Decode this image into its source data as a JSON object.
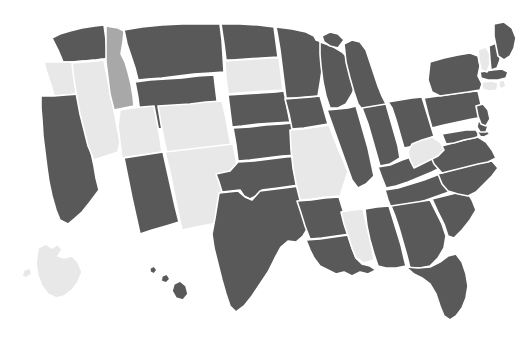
{
  "map": {
    "title": "United States choropleth map",
    "projection": "albers-usa",
    "background_color": "#ffffff",
    "border_color": "#ffffff",
    "border_width": 1.6,
    "legend_visible": false,
    "labels_visible": false,
    "categories": [
      {
        "key": "dark",
        "color": "#595959",
        "label": "highlighted"
      },
      {
        "key": "medium",
        "color": "#a8a8a8",
        "label": "partial"
      },
      {
        "key": "light",
        "color": "#e8e8e8",
        "label": "not highlighted"
      }
    ],
    "counts": {
      "dark": 36,
      "medium": 1,
      "light": 14
    },
    "states": [
      {
        "id": "WA",
        "name": "Washington",
        "category": "dark"
      },
      {
        "id": "OR",
        "name": "Oregon",
        "category": "light"
      },
      {
        "id": "CA",
        "name": "California",
        "category": "dark"
      },
      {
        "id": "NV",
        "name": "Nevada",
        "category": "light"
      },
      {
        "id": "ID",
        "name": "Idaho",
        "category": "medium"
      },
      {
        "id": "MT",
        "name": "Montana",
        "category": "dark"
      },
      {
        "id": "WY",
        "name": "Wyoming",
        "category": "dark"
      },
      {
        "id": "UT",
        "name": "Utah",
        "category": "light"
      },
      {
        "id": "AZ",
        "name": "Arizona",
        "category": "dark"
      },
      {
        "id": "CO",
        "name": "Colorado",
        "category": "light"
      },
      {
        "id": "NM",
        "name": "New Mexico",
        "category": "light"
      },
      {
        "id": "ND",
        "name": "North Dakota",
        "category": "dark"
      },
      {
        "id": "SD",
        "name": "South Dakota",
        "category": "light"
      },
      {
        "id": "NE",
        "name": "Nebraska",
        "category": "dark"
      },
      {
        "id": "KS",
        "name": "Kansas",
        "category": "dark"
      },
      {
        "id": "OK",
        "name": "Oklahoma",
        "category": "dark"
      },
      {
        "id": "TX",
        "name": "Texas",
        "category": "dark"
      },
      {
        "id": "MN",
        "name": "Minnesota",
        "category": "dark"
      },
      {
        "id": "IA",
        "name": "Iowa",
        "category": "dark"
      },
      {
        "id": "MO",
        "name": "Missouri",
        "category": "light"
      },
      {
        "id": "AR",
        "name": "Arkansas",
        "category": "dark"
      },
      {
        "id": "LA",
        "name": "Louisiana",
        "category": "dark"
      },
      {
        "id": "WI",
        "name": "Wisconsin",
        "category": "dark"
      },
      {
        "id": "IL",
        "name": "Illinois",
        "category": "dark"
      },
      {
        "id": "MI",
        "name": "Michigan",
        "category": "dark"
      },
      {
        "id": "IN",
        "name": "Indiana",
        "category": "dark"
      },
      {
        "id": "OH",
        "name": "Ohio",
        "category": "dark"
      },
      {
        "id": "KY",
        "name": "Kentucky",
        "category": "dark"
      },
      {
        "id": "TN",
        "name": "Tennessee",
        "category": "dark"
      },
      {
        "id": "MS",
        "name": "Mississippi",
        "category": "light"
      },
      {
        "id": "AL",
        "name": "Alabama",
        "category": "dark"
      },
      {
        "id": "GA",
        "name": "Georgia",
        "category": "dark"
      },
      {
        "id": "FL",
        "name": "Florida",
        "category": "dark"
      },
      {
        "id": "SC",
        "name": "South Carolina",
        "category": "dark"
      },
      {
        "id": "NC",
        "name": "North Carolina",
        "category": "dark"
      },
      {
        "id": "VA",
        "name": "Virginia",
        "category": "dark"
      },
      {
        "id": "WV",
        "name": "West Virginia",
        "category": "light"
      },
      {
        "id": "MD",
        "name": "Maryland",
        "category": "dark"
      },
      {
        "id": "DE",
        "name": "Delaware",
        "category": "dark"
      },
      {
        "id": "PA",
        "name": "Pennsylvania",
        "category": "dark"
      },
      {
        "id": "NJ",
        "name": "New Jersey",
        "category": "dark"
      },
      {
        "id": "NY",
        "name": "New York",
        "category": "dark"
      },
      {
        "id": "CT",
        "name": "Connecticut",
        "category": "light"
      },
      {
        "id": "RI",
        "name": "Rhode Island",
        "category": "light"
      },
      {
        "id": "MA",
        "name": "Massachusetts",
        "category": "dark"
      },
      {
        "id": "VT",
        "name": "Vermont",
        "category": "light"
      },
      {
        "id": "NH",
        "name": "New Hampshire",
        "category": "dark"
      },
      {
        "id": "ME",
        "name": "Maine",
        "category": "dark"
      },
      {
        "id": "AK",
        "name": "Alaska",
        "category": "light"
      },
      {
        "id": "HI",
        "name": "Hawaii",
        "category": "dark"
      }
    ]
  }
}
